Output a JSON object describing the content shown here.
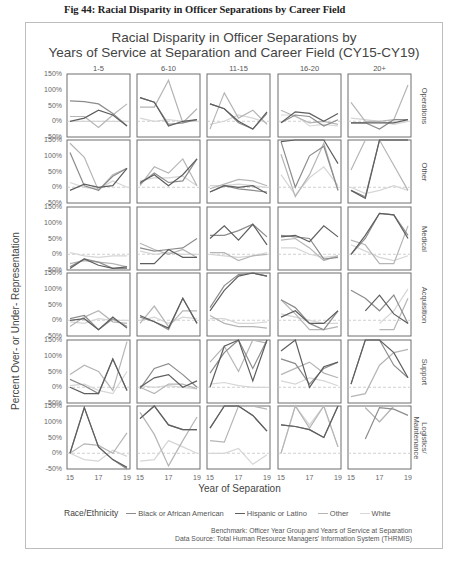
{
  "caption": "Fig 44:  Racial Disparity in Officer Separations by Career Field",
  "chart_data": {
    "type": "line",
    "title": "Racial Disparity in Officer Separations by",
    "subtitle": "Years of Service at Separation and Career Field (CY15-CY19)",
    "xlabel": "Year of Separation",
    "ylabel": "Percent Over- or Under- Representation",
    "x": [
      15,
      16,
      17,
      18,
      19
    ],
    "x_tick_labels": [
      "15",
      "17",
      "19"
    ],
    "ylim": [
      -50,
      150
    ],
    "y_tick_labels": [
      "150%",
      "100%",
      "50%",
      "0%",
      "-50%"
    ],
    "reference_line": 0,
    "grid": false,
    "legend_title": "Race/Ethnicity",
    "legend_position": "bottom",
    "columns": [
      "1-5",
      "6-10",
      "11-15",
      "16-20",
      "20+"
    ],
    "rows": [
      "Operations",
      "Other",
      "Medical",
      "Acquisition",
      "Support",
      "Logistics/ Maintenance"
    ],
    "series_names": [
      "Black or African American",
      "Hispanic or Latino",
      "Other",
      "White"
    ],
    "series_colors": [
      "#8c8c8c",
      "#5e5e5e",
      "#b5b5b5",
      "#d6d6d6"
    ],
    "panels": [
      {
        "row": "Operations",
        "col": "1-5",
        "series": {
          "Black or African American": [
            65,
            62,
            55,
            25,
            -15
          ],
          "Hispanic or Latino": [
            0,
            10,
            35,
            20,
            -15
          ],
          "Other": [
            15,
            15,
            -20,
            20,
            55
          ],
          "White": [
            0,
            0,
            0,
            0,
            0
          ]
        }
      },
      {
        "row": "Operations",
        "col": "6-10",
        "series": {
          "Black or African American": [
            75,
            60,
            -10,
            -5,
            5
          ],
          "Hispanic or Latino": [
            75,
            60,
            -15,
            0,
            5
          ],
          "Other": [
            45,
            45,
            130,
            -5,
            40
          ],
          "White": [
            10,
            0,
            5,
            0,
            0
          ]
        }
      },
      {
        "row": "Operations",
        "col": "11-15",
        "series": {
          "Black or African American": [
            55,
            40,
            -5,
            -25,
            25
          ],
          "Hispanic or Latino": [
            55,
            40,
            0,
            -25,
            30
          ],
          "Other": [
            -25,
            90,
            10,
            35,
            -10
          ],
          "White": [
            -10,
            0,
            20,
            10,
            -5
          ]
        }
      },
      {
        "row": "Operations",
        "col": "16-20",
        "series": {
          "Black or African American": [
            -5,
            20,
            15,
            -15,
            5
          ],
          "Hispanic or Latino": [
            -5,
            30,
            25,
            0,
            25
          ],
          "Other": [
            35,
            15,
            -5,
            0,
            -10
          ],
          "White": [
            20,
            20,
            -15,
            -10,
            -15
          ]
        }
      },
      {
        "row": "Operations",
        "col": "20+",
        "series": {
          "Black or African American": [
            -5,
            -5,
            -25,
            5,
            5
          ],
          "Hispanic or Latino": [
            -5,
            -5,
            -5,
            -5,
            5
          ],
          "Other": [
            60,
            0,
            0,
            5,
            115
          ],
          "White": [
            10,
            5,
            0,
            -10,
            0
          ]
        }
      },
      {
        "row": "Other",
        "col": "1-5",
        "series": {
          "Black or African American": [
            110,
            5,
            -10,
            35,
            60
          ],
          "Hispanic or Latino": [
            -10,
            10,
            0,
            5,
            60
          ],
          "Other": [
            140,
            95,
            -10,
            40,
            60
          ],
          "White": [
            15,
            0,
            -5,
            20,
            0
          ]
        }
      },
      {
        "row": "Other",
        "col": "6-10",
        "series": {
          "Black or African American": [
            10,
            45,
            15,
            20,
            90
          ],
          "Hispanic or Latino": [
            15,
            40,
            5,
            40,
            90
          ],
          "Other": [
            5,
            65,
            45,
            90,
            5
          ],
          "White": [
            20,
            30,
            30,
            35,
            5
          ]
        }
      },
      {
        "row": "Other",
        "col": "11-15",
        "series": {
          "Black or African American": [
            -15,
            5,
            -5,
            -10,
            -15
          ],
          "Hispanic or Latino": [
            -15,
            5,
            0,
            5,
            -20
          ],
          "Other": [
            -5,
            10,
            25,
            20,
            5
          ],
          "White": [
            5,
            5,
            10,
            5,
            0
          ]
        }
      },
      {
        "row": "Other",
        "col": "16-20",
        "series": {
          "Black or African American": [
            145,
            0,
            100,
            130,
            -10
          ],
          "Hispanic or Latino": [
            145,
            150,
            150,
            150,
            75
          ],
          "Other": [
            105,
            -30,
            40,
            140,
            -10
          ],
          "White": [
            40,
            -25,
            30,
            65,
            5
          ]
        }
      },
      {
        "row": "Other",
        "col": "20+",
        "series": {
          "Black or African American": [
            -10,
            -30,
            150,
            150,
            150
          ],
          "Hispanic or Latino": [
            -10,
            -35,
            150,
            150,
            150
          ],
          "Other": [
            55,
            150,
            150,
            70,
            -10
          ],
          "White": [
            0,
            -20,
            -10,
            5,
            -10
          ]
        }
      },
      {
        "row": "Medical",
        "col": "1-5",
        "series": {
          "Black or African American": [
            -40,
            -15,
            -25,
            -45,
            -45
          ],
          "Hispanic or Latino": [
            -45,
            -15,
            -35,
            -45,
            -40
          ],
          "Other": [
            -30,
            -20,
            -25,
            -30,
            -40
          ],
          "White": [
            5,
            -5,
            -10,
            -5,
            -5
          ]
        }
      },
      {
        "row": "Medical",
        "col": "6-10",
        "series": {
          "Black or African American": [
            20,
            10,
            15,
            20,
            50
          ],
          "Hispanic or Latino": [
            -30,
            -30,
            15,
            -10,
            -10
          ],
          "Other": [
            35,
            15,
            0,
            15,
            -10
          ],
          "White": [
            10,
            0,
            5,
            0,
            0
          ]
        }
      },
      {
        "row": "Medical",
        "col": "11-15",
        "series": {
          "Black or African American": [
            60,
            60,
            75,
            95,
            55
          ],
          "Hispanic or Latino": [
            50,
            90,
            45,
            95,
            30
          ],
          "Other": [
            5,
            5,
            -20,
            -5,
            0
          ],
          "White": [
            0,
            -5,
            -10,
            -5,
            5
          ]
        }
      },
      {
        "row": "Medical",
        "col": "16-20",
        "series": {
          "Black or African American": [
            60,
            55,
            50,
            -15,
            -10
          ],
          "Hispanic or Latino": [
            55,
            60,
            40,
            90,
            55
          ],
          "Other": [
            45,
            50,
            20,
            -20,
            -5
          ],
          "White": [
            20,
            20,
            0,
            -10,
            -5
          ]
        }
      },
      {
        "row": "Medical",
        "col": "20+",
        "series": {
          "Black or African American": [
            0,
            50,
            130,
            125,
            60
          ],
          "Hispanic or Latino": [
            0,
            60,
            130,
            125,
            50
          ],
          "Other": [
            45,
            30,
            -30,
            -30,
            90
          ],
          "White": [
            30,
            10,
            -10,
            -20,
            -5
          ]
        }
      },
      {
        "row": "Acquisition",
        "col": "1-5",
        "series": {
          "Black or African American": [
            5,
            15,
            -30,
            5,
            -20
          ],
          "Hispanic or Latino": [
            0,
            5,
            -30,
            10,
            -25
          ],
          "Other": [
            -20,
            10,
            30,
            -5,
            -10
          ],
          "White": [
            -5,
            -10,
            5,
            0,
            0
          ]
        }
      },
      {
        "row": "Acquisition",
        "col": "6-10",
        "series": {
          "Black or African American": [
            10,
            -5,
            -30,
            70,
            -10
          ],
          "Hispanic or Latino": [
            15,
            -5,
            -25,
            70,
            -10
          ],
          "Other": [
            -10,
            45,
            -20,
            30,
            30
          ],
          "White": [
            0,
            10,
            -10,
            10,
            5
          ]
        }
      },
      {
        "row": "Acquisition",
        "col": "11-15",
        "series": {
          "Black or African American": [
            40,
            110,
            145,
            150,
            140
          ],
          "Hispanic or Latino": [
            30,
            95,
            140,
            150,
            140
          ],
          "Other": [
            15,
            -10,
            -20,
            -20,
            -25
          ],
          "White": [
            5,
            5,
            -10,
            -10,
            -5
          ]
        }
      },
      {
        "row": "Acquisition",
        "col": "16-20",
        "series": {
          "Black or African American": [
            65,
            40,
            -10,
            -30,
            30
          ],
          "Hispanic or Latino": [
            10,
            30,
            -10,
            -10,
            30
          ],
          "Other": [
            65,
            20,
            -30,
            -30,
            -20
          ],
          "White": [
            20,
            10,
            0,
            -10,
            -10
          ]
        }
      },
      {
        "row": "Acquisition",
        "col": "20+",
        "series": {
          "Black or African American": [
            95,
            70,
            30,
            80,
            -10
          ],
          "Hispanic or Latino": [
            null,
            30,
            80,
            20,
            -10
          ],
          "Other": [
            null,
            null,
            -30,
            -30,
            70
          ],
          "White": [
            null,
            null,
            -10,
            30,
            100
          ]
        }
      },
      {
        "row": "Support",
        "col": "1-5",
        "series": {
          "Black or African American": [
            25,
            5,
            -20,
            90,
            -10
          ],
          "Hispanic or Latino": [
            0,
            -20,
            -20,
            90,
            -10
          ],
          "Other": [
            40,
            70,
            50,
            -10,
            145
          ],
          "White": [
            5,
            10,
            -10,
            -20,
            50
          ]
        }
      },
      {
        "row": "Support",
        "col": "6-10",
        "series": {
          "Black or African American": [
            -5,
            60,
            75,
            40,
            0
          ],
          "Hispanic or Latino": [
            0,
            30,
            40,
            0,
            20
          ],
          "Other": [
            0,
            -20,
            10,
            10,
            -5
          ],
          "White": [
            5,
            0,
            5,
            0,
            -5
          ]
        }
      },
      {
        "row": "Support",
        "col": "11-15",
        "series": {
          "Black or African American": [
            45,
            110,
            155,
            60,
            150
          ],
          "Hispanic or Latino": [
            0,
            130,
            160,
            20,
            150
          ],
          "Other": [
            80,
            130,
            50,
            150,
            140
          ],
          "White": [
            10,
            15,
            5,
            0,
            0
          ]
        }
      },
      {
        "row": "Support",
        "col": "16-20",
        "series": {
          "Black or African American": [
            90,
            75,
            10,
            60,
            80
          ],
          "Hispanic or Latino": [
            115,
            160,
            0,
            65,
            80
          ],
          "Other": [
            40,
            60,
            80,
            45,
            30
          ],
          "White": [
            20,
            10,
            30,
            20,
            5
          ]
        }
      },
      {
        "row": "Support",
        "col": "20+",
        "series": {
          "Black or African American": [
            10,
            160,
            160,
            70,
            30
          ],
          "Hispanic or Latino": [
            10,
            160,
            160,
            110,
            30
          ],
          "Other": [
            -30,
            -20,
            70,
            110,
            120
          ],
          "White": [
            null,
            null,
            null,
            null,
            null
          ]
        }
      },
      {
        "row": "Logistics/ Maintenance",
        "col": "1-5",
        "series": {
          "Black or African American": [
            0,
            145,
            20,
            -20,
            -50
          ],
          "Hispanic or Latino": [
            0,
            145,
            20,
            -20,
            -45
          ],
          "Other": [
            0,
            30,
            25,
            0,
            65
          ],
          "White": [
            0,
            -20,
            -25,
            10,
            -10
          ]
        }
      },
      {
        "row": "Logistics/ Maintenance",
        "col": "6-10",
        "series": {
          "Black or African American": [
            110,
            150,
            90,
            75,
            75
          ],
          "Hispanic or Latino": [
            110,
            150,
            90,
            75,
            75
          ],
          "Other": [
            130,
            60,
            -40,
            40,
            115
          ],
          "White": [
            -25,
            -20,
            40,
            20,
            0
          ]
        }
      },
      {
        "row": "Logistics/ Maintenance",
        "col": "11-15",
        "series": {
          "Black or African American": [
            80,
            150,
            150,
            120,
            70
          ],
          "Hispanic or Latino": [
            80,
            150,
            150,
            120,
            70
          ],
          "Other": [
            40,
            35,
            150,
            150,
            140
          ],
          "White": [
            0,
            0,
            15,
            -35,
            -5
          ]
        }
      },
      {
        "row": "Logistics/ Maintenance",
        "col": "16-20",
        "series": {
          "Black or African American": [
            90,
            85,
            75,
            50,
            150
          ],
          "Hispanic or Latino": [
            90,
            85,
            75,
            50,
            150
          ],
          "Other": [
            0,
            150,
            80,
            150,
            20
          ],
          "White": [
            0,
            160,
            90,
            150,
            20
          ]
        }
      },
      {
        "row": "Logistics/ Maintenance",
        "col": "20+",
        "series": {
          "Black or African American": [
            null,
            45,
            145,
            140,
            120
          ],
          "Hispanic or Latino": [
            null,
            null,
            null,
            null,
            null
          ],
          "Other": [
            null,
            145,
            100,
            150,
            150
          ],
          "White": [
            null,
            145,
            100,
            150,
            150
          ]
        }
      }
    ]
  },
  "legend": {
    "title": "Race/Ethnicity",
    "items": [
      "Black or African American",
      "Hispanic or Latino",
      "Other",
      "White"
    ]
  },
  "notes": {
    "benchmark": "Benchmark: Officer Year Group and Years of Service at Separation",
    "source": "Data Source: Total Human Resource Managers' Information System (THRMIS)"
  }
}
